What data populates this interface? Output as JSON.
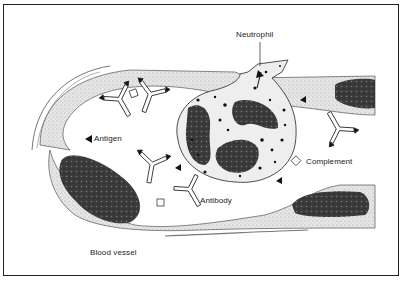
{
  "diagram": {
    "labels": {
      "neutrophil": "Neutrophil",
      "antigen": "Antigen",
      "complement": "Complement",
      "antibody": "Antibody",
      "blood_vessel": "Blood vessel"
    },
    "complement_symbol": "C",
    "colors": {
      "ink": "#1a1a1a",
      "vessel_wall": "#cfcfcf",
      "nucleus": "#2a2a2a",
      "background": "#ffffff"
    }
  }
}
